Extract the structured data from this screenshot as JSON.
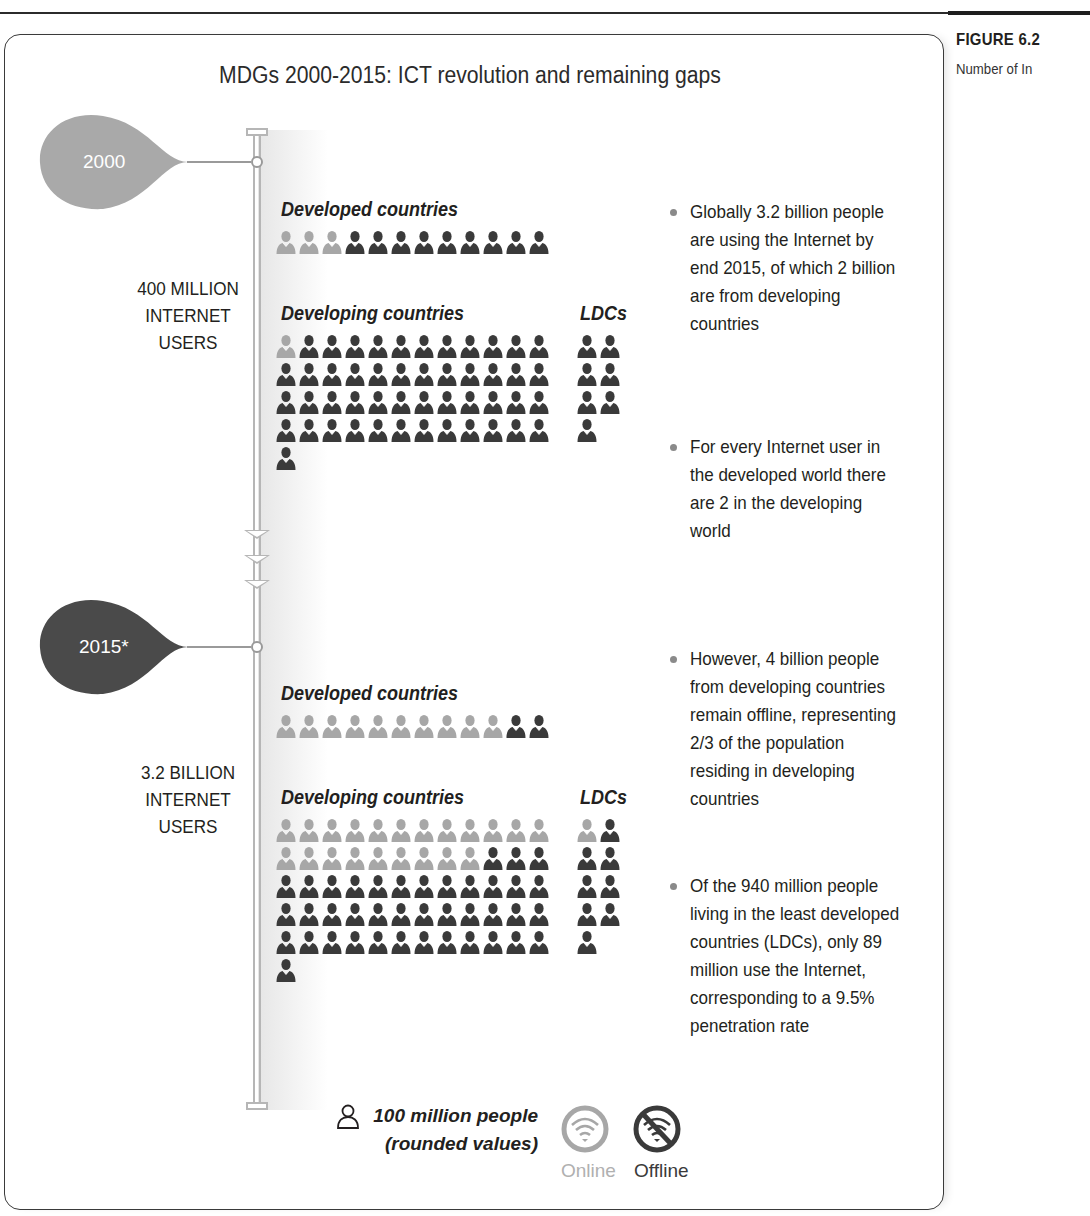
{
  "figure": {
    "label": "FIGURE 6.2",
    "subtitle_visible": "Number of In"
  },
  "chart_data": {
    "type": "pictogram",
    "title": "MDGs 2000-2015: ICT revolution and remaining gaps",
    "unit": "100 million people (rounded values)",
    "legend": [
      {
        "name": "Online",
        "color": "#a7a7a7"
      },
      {
        "name": "Offline",
        "color": "#3a3a3a"
      }
    ],
    "periods": [
      {
        "year": "2000",
        "summary": "400 MILLION INTERNET USERS",
        "groups": [
          {
            "name": "Developed countries",
            "total_icons": 12,
            "online_icons": 3,
            "offline_icons": 9
          },
          {
            "name": "Developing countries",
            "total_icons": 49,
            "online_icons": 1,
            "offline_icons": 48
          },
          {
            "name": "LDCs",
            "total_icons": 7,
            "online_icons": 0,
            "offline_icons": 7
          }
        ]
      },
      {
        "year": "2015*",
        "summary": "3.2 BILLION INTERNET USERS",
        "groups": [
          {
            "name": "Developed countries",
            "total_icons": 12,
            "online_icons": 10,
            "offline_icons": 2
          },
          {
            "name": "Developing countries",
            "total_icons": 61,
            "online_icons": 21,
            "offline_icons": 40
          },
          {
            "name": "LDCs",
            "total_icons": 9,
            "online_icons": 1,
            "offline_icons": 8
          }
        ]
      }
    ]
  },
  "timeline": {
    "p2000": {
      "year": "2000",
      "users_line1": "400 MILLION",
      "users_line2": "INTERNET",
      "users_line3": "USERS",
      "developed_label": "Developed countries",
      "developing_label": "Developing countries",
      "ldc_label": "LDCs",
      "bubble_color": "#a9a9a9"
    },
    "p2015": {
      "year": "2015*",
      "users_line1": "3.2 BILLION",
      "users_line2": "INTERNET",
      "users_line3": "USERS",
      "developed_label": "Developed countries",
      "developing_label": "Developing countries",
      "ldc_label": "LDCs",
      "bubble_color": "#4a4a4a"
    }
  },
  "bullets": [
    "Globally 3.2 billion people are using the Internet by end 2015, of which 2 billion are from developing countries",
    "For every Internet user in the developed world there are 2 in the developing world",
    "However, 4 billion people from developing countries remain offline, representing 2/3 of the population residing in developing countries",
    "Of the 940 million people living in the least developed countries (LDCs), only 89 million use the Internet, corresponding to a 9.5% penetration rate"
  ],
  "legend": {
    "unit_line1": "100 million people",
    "unit_line2": "(rounded values)",
    "online_label": "Online",
    "offline_label": "Offline",
    "online_color": "#a7a7a7",
    "offline_color": "#3a3a3a"
  }
}
